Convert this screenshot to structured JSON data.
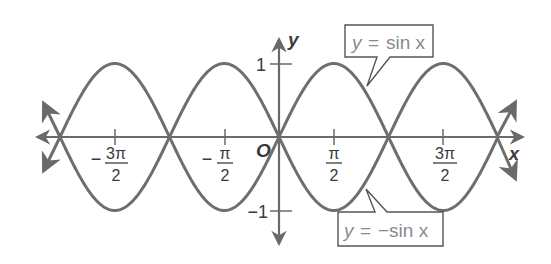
{
  "chart_data": {
    "type": "line",
    "title": "",
    "xlabel": "x",
    "ylabel": "y",
    "origin_label": "O",
    "x_range": [
      -5.0265,
      5.0265
    ],
    "ylim": [
      -1,
      1
    ],
    "grid": false,
    "x_ticks": [
      {
        "value": -4.7124,
        "label_sign": "−",
        "label_num": "3π",
        "label_den": "2"
      },
      {
        "value": -1.5708,
        "label_sign": "−",
        "label_num": "π",
        "label_den": "2"
      },
      {
        "value": 1.5708,
        "label_sign": "",
        "label_num": "π",
        "label_den": "2"
      },
      {
        "value": 4.7124,
        "label_sign": "",
        "label_num": "3π",
        "label_den": "2"
      }
    ],
    "y_ticks": [
      {
        "value": 1,
        "label": "1"
      },
      {
        "value": -1,
        "label": "−1"
      }
    ],
    "series": [
      {
        "name": "y = sin x",
        "function": "sin",
        "x": [
          -6.2832,
          -4.7124,
          -3.1416,
          -1.5708,
          0,
          1.5708,
          3.1416,
          4.7124,
          6.2832
        ],
        "values": [
          0,
          1,
          0,
          -1,
          0,
          1,
          0,
          -1,
          0
        ]
      },
      {
        "name": "y = −sin x",
        "function": "-sin",
        "x": [
          -6.2832,
          -4.7124,
          -3.1416,
          -1.5708,
          0,
          1.5708,
          3.1416,
          4.7124,
          6.2832
        ],
        "values": [
          0,
          -1,
          0,
          1,
          0,
          -1,
          0,
          1,
          0
        ]
      }
    ],
    "annotations": [
      {
        "text_y": "y",
        "text_eq": "=",
        "text_rest": "sin x",
        "label": "y = sin x",
        "points_to": "sin curve near x ≈ 2.3"
      },
      {
        "text_y": "y",
        "text_eq": "=",
        "text_rest": "−sin x",
        "label": "y = −sin x",
        "points_to": "−sin curve near x ≈ 2.3"
      }
    ]
  },
  "colors": {
    "curve": "#6e6e6e",
    "axis": "#6a6a6a",
    "text": "#3a3a3a",
    "callout_text": "#8a8a8a"
  }
}
